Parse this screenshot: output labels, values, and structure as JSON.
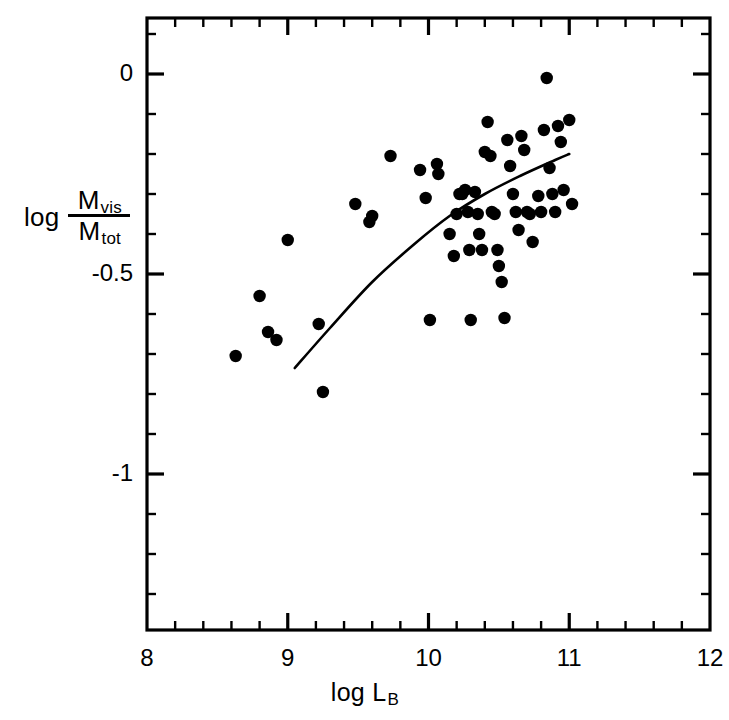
{
  "axes": {
    "x_label_prefix": "log L",
    "x_label_sub": "B",
    "y_label_prefix": "log",
    "y_label_numerator": "M",
    "y_label_numerator_sub": "vis",
    "y_label_denominator": "M",
    "y_label_denominator_sub": "tot",
    "x_ticks": [
      "8",
      "9",
      "10",
      "11",
      "12"
    ],
    "y_ticks": [
      "0",
      "-0.5",
      "-1"
    ],
    "frame_color": "#000000",
    "marker_color": "#000000",
    "curve_color": "#000000"
  },
  "chart_data": {
    "type": "scatter",
    "title": "",
    "xlabel": "log L_B",
    "ylabel": "log (M_vis / M_tot)",
    "xlim": [
      8,
      12
    ],
    "ylim": [
      -1.39,
      0.14
    ],
    "grid": false,
    "legend": false,
    "x_major_ticks": [
      8,
      9,
      10,
      11,
      12
    ],
    "y_major_ticks": [
      0,
      -0.5,
      -1
    ],
    "x_minor_interval": 0.2,
    "y_minor_interval": 0.1,
    "points": [
      [
        8.63,
        -0.705
      ],
      [
        8.8,
        -0.555
      ],
      [
        8.86,
        -0.645
      ],
      [
        8.92,
        -0.665
      ],
      [
        9.0,
        -0.415
      ],
      [
        9.22,
        -0.625
      ],
      [
        9.25,
        -0.795
      ],
      [
        9.48,
        -0.325
      ],
      [
        9.58,
        -0.37
      ],
      [
        9.6,
        -0.355
      ],
      [
        9.73,
        -0.205
      ],
      [
        9.94,
        -0.24
      ],
      [
        9.98,
        -0.31
      ],
      [
        10.01,
        -0.615
      ],
      [
        10.06,
        -0.225
      ],
      [
        10.07,
        -0.25
      ],
      [
        10.15,
        -0.4
      ],
      [
        10.18,
        -0.455
      ],
      [
        10.2,
        -0.35
      ],
      [
        10.22,
        -0.3
      ],
      [
        10.24,
        -0.3
      ],
      [
        10.26,
        -0.29
      ],
      [
        10.28,
        -0.345
      ],
      [
        10.29,
        -0.44
      ],
      [
        10.3,
        -0.615
      ],
      [
        10.33,
        -0.295
      ],
      [
        10.35,
        -0.35
      ],
      [
        10.36,
        -0.4
      ],
      [
        10.38,
        -0.44
      ],
      [
        10.4,
        -0.195
      ],
      [
        10.42,
        -0.12
      ],
      [
        10.44,
        -0.205
      ],
      [
        10.45,
        -0.345
      ],
      [
        10.47,
        -0.35
      ],
      [
        10.49,
        -0.44
      ],
      [
        10.5,
        -0.48
      ],
      [
        10.52,
        -0.52
      ],
      [
        10.54,
        -0.61
      ],
      [
        10.56,
        -0.165
      ],
      [
        10.58,
        -0.23
      ],
      [
        10.6,
        -0.3
      ],
      [
        10.62,
        -0.345
      ],
      [
        10.64,
        -0.39
      ],
      [
        10.66,
        -0.155
      ],
      [
        10.68,
        -0.19
      ],
      [
        10.7,
        -0.345
      ],
      [
        10.72,
        -0.35
      ],
      [
        10.74,
        -0.42
      ],
      [
        10.78,
        -0.305
      ],
      [
        10.8,
        -0.345
      ],
      [
        10.82,
        -0.14
      ],
      [
        10.84,
        -0.01
      ],
      [
        10.86,
        -0.235
      ],
      [
        10.88,
        -0.3
      ],
      [
        10.9,
        -0.345
      ],
      [
        10.92,
        -0.13
      ],
      [
        10.94,
        -0.17
      ],
      [
        10.96,
        -0.29
      ],
      [
        11.0,
        -0.115
      ],
      [
        11.02,
        -0.325
      ]
    ],
    "fit_curve": {
      "label": "",
      "x": [
        9.05,
        9.3,
        9.6,
        9.9,
        10.15,
        10.4,
        10.65,
        10.9,
        11.0
      ],
      "y": [
        -0.735,
        -0.635,
        -0.52,
        -0.425,
        -0.355,
        -0.3,
        -0.255,
        -0.215,
        -0.2
      ]
    }
  }
}
